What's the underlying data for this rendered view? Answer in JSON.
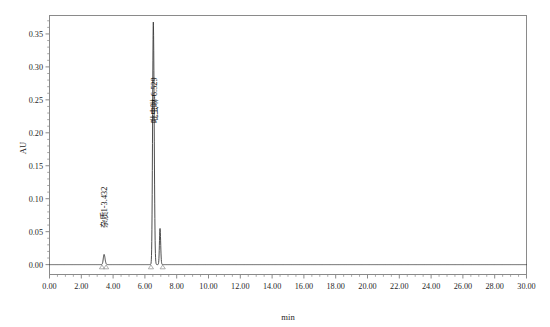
{
  "chart_data": {
    "type": "line",
    "title": "",
    "xlabel": "min",
    "ylabel": "AU",
    "xlim": [
      0.0,
      30.0
    ],
    "ylim": [
      -0.015,
      0.378
    ],
    "grid": false,
    "legend": null,
    "x_ticks": [
      "0.00",
      "2.00",
      "4.00",
      "6.00",
      "8.00",
      "10.00",
      "12.00",
      "14.00",
      "16.00",
      "18.00",
      "20.00",
      "22.00",
      "24.00",
      "26.00",
      "28.00",
      "30.00"
    ],
    "x_tick_values": [
      0,
      2,
      4,
      6,
      8,
      10,
      12,
      14,
      16,
      18,
      20,
      22,
      24,
      26,
      28,
      30
    ],
    "x_minor_per_major": 4,
    "y_ticks": [
      "0.00",
      "0.05",
      "0.10",
      "0.15",
      "0.20",
      "0.25",
      "0.30",
      "0.35"
    ],
    "y_tick_values": [
      0.0,
      0.05,
      0.1,
      0.15,
      0.2,
      0.25,
      0.3,
      0.35
    ],
    "y_minor_per_major": 5,
    "baseline": 0.0,
    "series": [
      {
        "name": "UV trace",
        "color": "#3a3a3a",
        "peaks": [
          {
            "label": "杂质1-3.432",
            "retention_time": 3.432,
            "height": 0.0155,
            "width": 0.115,
            "tailing": 1.25
          },
          {
            "label": "吡虫啉-6.529",
            "retention_time": 6.529,
            "height": 0.368,
            "width": 0.105,
            "tailing": 1.2
          },
          {
            "label": "",
            "retention_time": 6.95,
            "height": 0.055,
            "width": 0.085,
            "tailing": 1.15
          }
        ]
      }
    ],
    "annotations": [
      {
        "text": "杂质1-3.432",
        "retention_time": 3.432,
        "value": 0.055,
        "rotation": -90
      },
      {
        "text": "吡虫啉-6.529",
        "retention_time": 6.529,
        "value": 0.215,
        "rotation": -90
      }
    ],
    "integration_markers": [
      {
        "retention_time": 3.3
      },
      {
        "retention_time": 3.56
      },
      {
        "retention_time": 6.38
      },
      {
        "retention_time": 7.12
      }
    ]
  }
}
